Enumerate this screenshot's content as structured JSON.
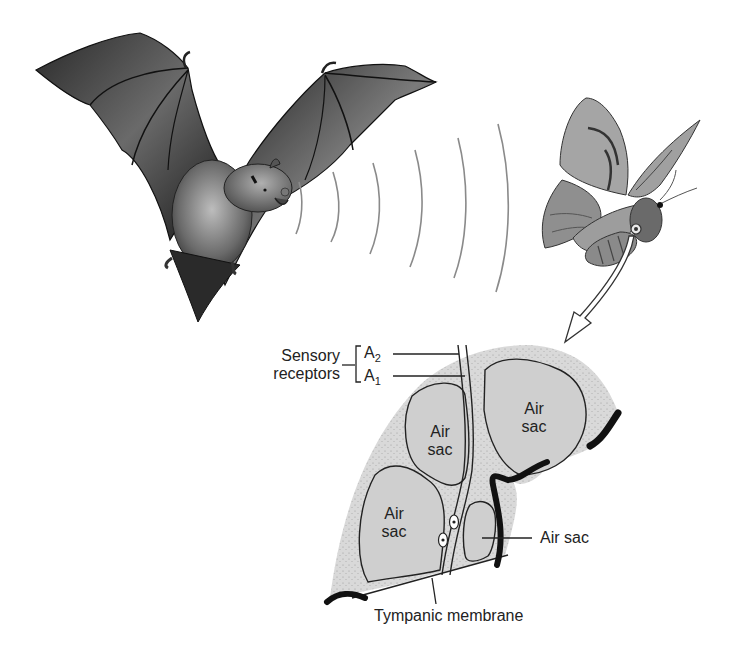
{
  "figure": {
    "colors": {
      "bat_dark": "#1c1c1c",
      "bat_mid": "#5a5a5a",
      "moth_fill": "#9a9a9a",
      "moth_dark": "#3c3c3c",
      "wave": "#8a8a8a",
      "tissue": "#d8d8d8",
      "air_sac": "#cfcfcf",
      "outline": "#222222",
      "cuticle": "#111111"
    }
  },
  "labels": {
    "sensory_receptors_line1": "Sensory",
    "sensory_receptors_line2": "receptors",
    "a2_base": "A",
    "a2_sub": "2",
    "a1_base": "A",
    "a1_sub": "1",
    "air_sac_top_left_1": "Air",
    "air_sac_top_left_2": "sac",
    "air_sac_top_right_1": "Air",
    "air_sac_top_right_2": "sac",
    "air_sac_bottom_left_1": "Air",
    "air_sac_bottom_left_2": "sac",
    "air_sac_small": "Air sac",
    "tympanic_membrane": "Tympanic membrane"
  },
  "icons": {
    "bat": "bat-illustration",
    "moth": "moth-illustration",
    "sound_waves": "echolocation-wave-arcs",
    "zoom_arrow": "callout-arrow",
    "ear_section": "tympanic-organ-cross-section"
  }
}
